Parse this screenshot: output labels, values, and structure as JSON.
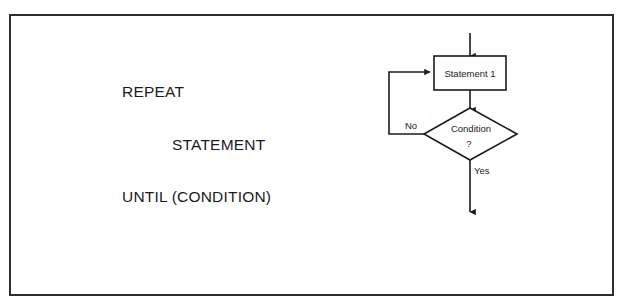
{
  "page": {
    "background_color": "#ffffff",
    "frame_color": "#2e2e2e"
  },
  "pseudocode": {
    "lines": [
      {
        "text": "REPEAT",
        "indent": false
      },
      {
        "text": "STATEMENT",
        "indent": true
      },
      {
        "text": "UNTIL (CONDITION)",
        "indent": false
      }
    ]
  },
  "flowchart": {
    "ink_color": "#1b1b1b",
    "nodes": {
      "process": {
        "label": "Statement 1",
        "shape": "rectangle"
      },
      "decision": {
        "label_line1": "Condition",
        "label_line2": "?",
        "shape": "diamond"
      }
    },
    "edges": {
      "entry": {
        "label": ""
      },
      "process_to_decision": {
        "label": ""
      },
      "loop_back": {
        "label": "No"
      },
      "exit": {
        "label": "Yes"
      }
    }
  }
}
